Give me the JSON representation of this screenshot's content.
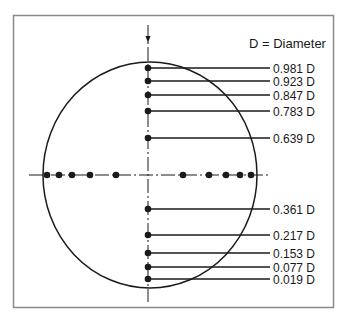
{
  "legend": {
    "text": "D = Diameter"
  },
  "colors": {
    "stroke": "#1a1a1a",
    "border": "#8a8a8a",
    "background": "#ffffff"
  },
  "geometry": {
    "circle": {
      "cx": 150,
      "cy": 175,
      "rx": 107,
      "ry": 113
    },
    "vertical_axis_x": 148,
    "horizontal_axis_y": 175
  },
  "vertical_points": [
    {
      "label": "0.981 D",
      "value": 0.981,
      "y": 68
    },
    {
      "label": "0.923 D",
      "value": 0.923,
      "y": 81
    },
    {
      "label": "0.847 D",
      "value": 0.847,
      "y": 95
    },
    {
      "label": "0.783 D",
      "value": 0.783,
      "y": 111
    },
    {
      "label": "0.639 D",
      "value": 0.639,
      "y": 138
    },
    {
      "label": "0.361 D",
      "value": 0.361,
      "y": 209
    },
    {
      "label": "0.217 D",
      "value": 0.217,
      "y": 235
    },
    {
      "label": "0.153 D",
      "value": 0.153,
      "y": 253
    },
    {
      "label": "0.077 D",
      "value": 0.077,
      "y": 267
    },
    {
      "label": "0.019 D",
      "value": 0.019,
      "y": 279
    }
  ],
  "horizontal_points_x": [
    47,
    59,
    72,
    90,
    116,
    183,
    209,
    226,
    240,
    251
  ]
}
